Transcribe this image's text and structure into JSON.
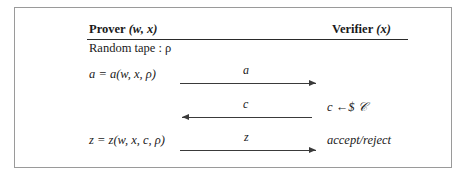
{
  "diagram": {
    "border_color": "#9a9a9a",
    "ink_color": "#1a1a1a"
  },
  "columns": {
    "prover": {
      "role": "Prover",
      "args": "(w, x)"
    },
    "verifier": {
      "role": "Verifier",
      "args": "(x)"
    }
  },
  "setup": {
    "random_tape": "Random tape : ρ"
  },
  "rows": [
    {
      "left": "a = a(w, x, ρ)",
      "arrow_label": "a",
      "direction": "right",
      "right": ""
    },
    {
      "left": "",
      "arrow_label": "c",
      "direction": "left",
      "right": "c ←$ 𝒞"
    },
    {
      "left": "z = z(w, x, c, ρ)",
      "arrow_label": "z",
      "direction": "right",
      "right": "accept/reject"
    }
  ]
}
